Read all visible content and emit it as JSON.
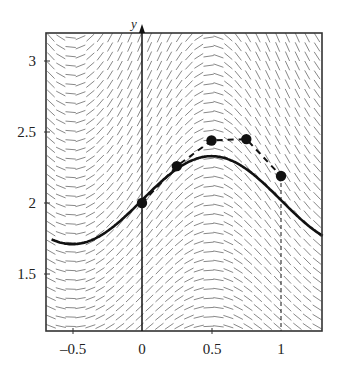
{
  "chart_data": {
    "type": "line",
    "title": "",
    "subtitle": "",
    "xlabel": "",
    "ylabel": "y",
    "xlim": [
      -0.65,
      1.3
    ],
    "ylim": [
      1.1,
      3.2
    ],
    "grid": false,
    "legend": null,
    "x_ticks": [
      -0.5,
      0,
      0.5,
      1
    ],
    "x_tick_labels": [
      "–0.5",
      "0",
      "0.5",
      "1"
    ],
    "y_ticks": [
      1.5,
      2,
      2.5,
      3
    ],
    "y_tick_labels": [
      "1.5",
      "2",
      "2.5",
      "3"
    ],
    "series": [
      {
        "name": "solution curve",
        "style": "solid-thick",
        "x": [
          -0.65,
          -0.5,
          -0.25,
          0,
          0.25,
          0.5,
          0.75,
          1,
          1.3
        ],
        "values": [
          1.75,
          1.71,
          1.79,
          2.0,
          2.24,
          2.33,
          2.24,
          2.0,
          1.76
        ]
      },
      {
        "name": "Euler approximation",
        "style": "dashed-with-markers",
        "x": [
          0,
          0.25,
          0.5,
          0.75,
          1
        ],
        "values": [
          2.0,
          2.26,
          2.44,
          2.45,
          2.19
        ]
      }
    ],
    "annotations": [
      {
        "type": "vertical-dashed-line",
        "x": 1,
        "from_y": 1.1,
        "to_y": 2.19
      }
    ],
    "slope_field": {
      "present": true,
      "rows": 32,
      "cols": 28
    }
  },
  "labels": {
    "y_axis_name": "y",
    "x_ticks": [
      "–0.5",
      "0",
      "0.5",
      "1"
    ],
    "y_ticks": [
      "3",
      "2.5",
      "2",
      "1.5"
    ]
  },
  "colors": {
    "ink": "#111111",
    "field": "#7a7a7a",
    "frame": "#333333"
  }
}
